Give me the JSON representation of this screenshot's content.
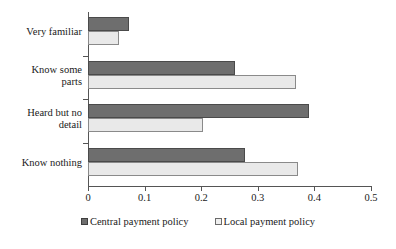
{
  "chart_data": {
    "type": "bar",
    "orientation": "horizontal",
    "title": "",
    "xlabel": "",
    "ylabel": "",
    "xlim": [
      0,
      0.5
    ],
    "xticks": [
      "0",
      "0.1",
      "0.2",
      "0.3",
      "0.4",
      "0.5"
    ],
    "xtick_values": [
      0,
      0.1,
      0.2,
      0.3,
      0.4,
      0.5
    ],
    "grid": false,
    "legend_position": "bottom",
    "categories": [
      "Very familiar",
      "Know some\nparts",
      "Heard but no\ndetail",
      "Know nothing"
    ],
    "series": [
      {
        "name": "Central payment policy",
        "color": "#6e6e6e",
        "values": [
          0.072,
          0.26,
          0.39,
          0.277
        ]
      },
      {
        "name": "Local payment policy",
        "color": "#e9e9e9",
        "values": [
          0.055,
          0.367,
          0.203,
          0.371
        ]
      }
    ]
  },
  "legend": {
    "entries": [
      {
        "label": "Central payment policy",
        "swatch": "filled-dark-square-icon"
      },
      {
        "label": "Local payment policy",
        "swatch": "outlined-light-square-icon"
      }
    ]
  }
}
